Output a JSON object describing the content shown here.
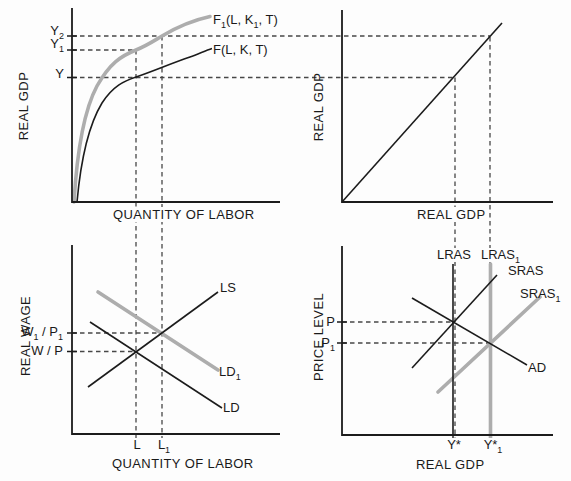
{
  "colors": {
    "line_black": "#1c1c1c",
    "accent_gray": "#adadad",
    "dashed_gray": "#474747",
    "background": "#fdfdfd",
    "text": "#1a1a1a"
  },
  "panels": {
    "production_function": {
      "y_axis_title": "REAL GDP",
      "x_axis_title": "QUANTITY OF LABOR",
      "labels": {
        "y2": [
          {
            "t": "Y"
          },
          {
            "t": "2",
            "sub": true
          }
        ],
        "y1": [
          {
            "t": "Y"
          },
          {
            "t": "1",
            "sub": true
          }
        ],
        "y": [
          {
            "t": "Y"
          }
        ],
        "f1": [
          {
            "t": "F"
          },
          {
            "t": "1",
            "sub": true
          },
          {
            "t": "(L, K"
          },
          {
            "t": "1",
            "sub": true
          },
          {
            "t": ", T)"
          }
        ],
        "f": [
          {
            "t": "F(L, K, T)"
          }
        ]
      }
    },
    "forty_five_degree": {
      "y_axis_title": "REAL GDP",
      "x_axis_title": "REAL GDP"
    },
    "labor_market": {
      "y_axis_title": "REAL WAGE",
      "x_axis_title": "QUANTITY OF LABOR",
      "labels": {
        "w1p1": [
          {
            "t": "W"
          },
          {
            "t": "1",
            "sub": true
          },
          {
            "t": " / P"
          },
          {
            "t": "1",
            "sub": true
          }
        ],
        "wp": [
          {
            "t": "W / P"
          }
        ],
        "ls": [
          {
            "t": "LS"
          }
        ],
        "ld1": [
          {
            "t": "LD"
          },
          {
            "t": "1",
            "sub": true
          }
        ],
        "ld": [
          {
            "t": "LD"
          }
        ],
        "l": [
          {
            "t": "L"
          }
        ],
        "l1": [
          {
            "t": "L"
          },
          {
            "t": "1",
            "sub": true
          }
        ]
      }
    },
    "ad_as": {
      "y_axis_title": "PRICE LEVEL",
      "x_axis_title": "REAL GDP",
      "labels": {
        "p": [
          {
            "t": "P"
          }
        ],
        "p1": [
          {
            "t": "P"
          },
          {
            "t": "1",
            "sub": true
          }
        ],
        "lras": [
          {
            "t": "LRAS"
          }
        ],
        "lras1": [
          {
            "t": "LRAS"
          },
          {
            "t": "1",
            "sub": true
          }
        ],
        "sras": [
          {
            "t": "SRAS"
          }
        ],
        "sras1": [
          {
            "t": "SRAS"
          },
          {
            "t": "1",
            "sub": true
          }
        ],
        "ad": [
          {
            "t": "AD"
          }
        ],
        "ystar": [
          {
            "t": "Y*"
          }
        ],
        "ystar1": [
          {
            "t": "Y*"
          },
          {
            "t": "1",
            "sub": true
          }
        ]
      }
    }
  }
}
